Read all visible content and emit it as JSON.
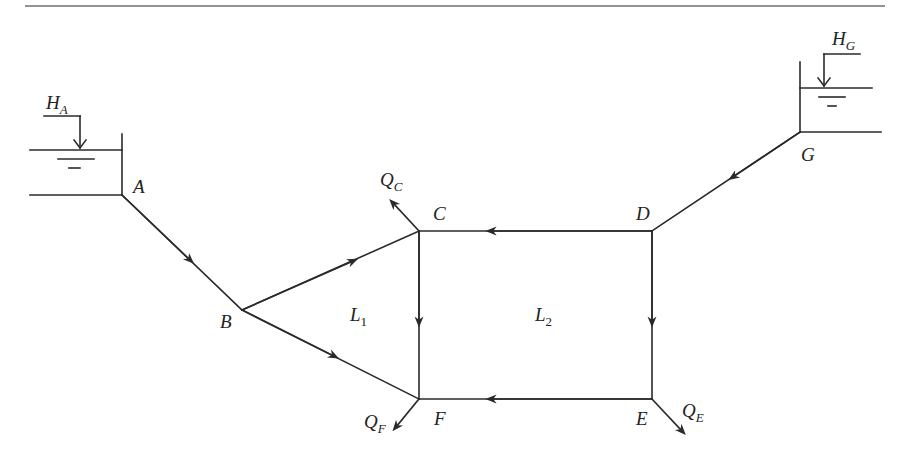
{
  "diagram": {
    "type": "pipe-network",
    "nodes": [
      {
        "id": "A",
        "label": "A"
      },
      {
        "id": "B",
        "label": "B"
      },
      {
        "id": "C",
        "label": "C"
      },
      {
        "id": "D",
        "label": "D"
      },
      {
        "id": "E",
        "label": "E"
      },
      {
        "id": "F",
        "label": "F"
      },
      {
        "id": "G",
        "label": "G"
      }
    ],
    "reservoirs": [
      {
        "id": "A",
        "head_label": "H",
        "head_subscript": "A"
      },
      {
        "id": "G",
        "head_label": "H",
        "head_subscript": "G"
      }
    ],
    "outflows": [
      {
        "node": "C",
        "label": "Q",
        "subscript": "C"
      },
      {
        "node": "F",
        "label": "Q",
        "subscript": "F"
      },
      {
        "node": "E",
        "label": "Q",
        "subscript": "E"
      }
    ],
    "loops": [
      {
        "label": "L",
        "subscript": "1"
      },
      {
        "label": "L",
        "subscript": "2"
      }
    ],
    "pipes": [
      {
        "from": "A",
        "to": "B"
      },
      {
        "from": "B",
        "to": "C"
      },
      {
        "from": "B",
        "to": "F"
      },
      {
        "from": "C",
        "to": "F"
      },
      {
        "from": "D",
        "to": "C"
      },
      {
        "from": "D",
        "to": "E"
      },
      {
        "from": "E",
        "to": "F"
      },
      {
        "from": "G",
        "to": "D"
      }
    ]
  }
}
